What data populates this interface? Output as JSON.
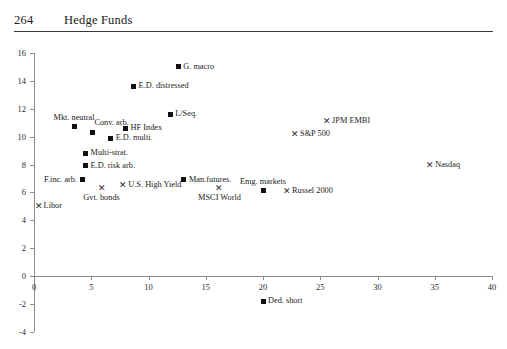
{
  "header": {
    "page_number": "264",
    "running_head": "Hedge Funds"
  },
  "chart_data": {
    "type": "scatter",
    "title": "",
    "subtitle": "",
    "xlabel": "",
    "ylabel": "",
    "xlim": [
      0,
      40
    ],
    "ylim": [
      -4,
      16
    ],
    "xticks": [
      0,
      5,
      10,
      15,
      20,
      25,
      30,
      35,
      40
    ],
    "yticks": [
      -4,
      -2,
      0,
      2,
      4,
      6,
      8,
      10,
      12,
      14,
      16
    ],
    "xtick_labels": [
      "0",
      "5",
      "10",
      "15",
      "20",
      "25",
      "30",
      "35",
      "40"
    ],
    "ytick_labels": [
      "-4",
      "-2",
      "0",
      "2",
      "4",
      "6",
      "8",
      "10",
      "12",
      "14",
      "16"
    ],
    "grid": false,
    "legend": "none",
    "series": [
      {
        "name": "Hedge fund strategies",
        "marker": "square",
        "color": "#111111",
        "points": [
          {
            "label": "G. macro",
            "x": 12.6,
            "y": 15.0,
            "label_pos": "right"
          },
          {
            "label": "E.D. distressed",
            "x": 8.7,
            "y": 13.6,
            "label_pos": "right"
          },
          {
            "label": "L/Seq.",
            "x": 11.9,
            "y": 11.6,
            "label_pos": "right"
          },
          {
            "label": "Mkt. neutral",
            "x": 3.5,
            "y": 10.7,
            "label_pos": "above"
          },
          {
            "label": "Conv. arb.",
            "x": 5.1,
            "y": 10.3,
            "label_pos": "above-right"
          },
          {
            "label": "HF Index",
            "x": 8.0,
            "y": 10.6,
            "label_pos": "right"
          },
          {
            "label": "E.D. multi.",
            "x": 6.7,
            "y": 9.9,
            "label_pos": "right"
          },
          {
            "label": "Multi-strat.",
            "x": 4.5,
            "y": 8.8,
            "label_pos": "right"
          },
          {
            "label": "E.D. risk arb.",
            "x": 4.5,
            "y": 7.9,
            "label_pos": "right"
          },
          {
            "label": "F.inc. arb.",
            "x": 4.2,
            "y": 6.9,
            "label_pos": "left"
          },
          {
            "label": "Man.futures.",
            "x": 13.1,
            "y": 6.9,
            "label_pos": "right"
          },
          {
            "label": "Emg. markets",
            "x": 20.0,
            "y": 6.1,
            "label_pos": "above"
          },
          {
            "label": "Ded. short",
            "x": 20.0,
            "y": -1.8,
            "label_pos": "right"
          }
        ]
      },
      {
        "name": "Market benchmarks",
        "marker": "cross",
        "color": "#2b2b2b",
        "points": [
          {
            "label": "JPM EMBI",
            "x": 25.6,
            "y": 11.1,
            "label_pos": "right"
          },
          {
            "label": "S&P 500",
            "x": 22.8,
            "y": 10.2,
            "label_pos": "right"
          },
          {
            "label": "Nasdaq",
            "x": 34.6,
            "y": 8.0,
            "label_pos": "right"
          },
          {
            "label": "Russel 2000",
            "x": 22.1,
            "y": 6.1,
            "label_pos": "right"
          },
          {
            "label": "U.S. High Yield",
            "x": 7.8,
            "y": 6.5,
            "label_pos": "right"
          },
          {
            "label": "Gvt. bonds",
            "x": 5.9,
            "y": 6.3,
            "label_pos": "below"
          },
          {
            "label": "MSCI World",
            "x": 16.2,
            "y": 6.3,
            "label_pos": "below"
          },
          {
            "label": "Libor",
            "x": 0.4,
            "y": 5.0,
            "label_pos": "right"
          }
        ]
      }
    ]
  }
}
